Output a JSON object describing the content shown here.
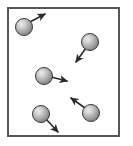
{
  "figure": {
    "title": "Gas particles in a container with velocity vectors",
    "canvas": {
      "width": 133,
      "height": 146
    },
    "background_color": "#ffffff"
  },
  "container_box": {
    "name": "container-box",
    "description": "Rectangular container enclosing the particles",
    "x": 8,
    "y": 8,
    "width": 111,
    "height": 128,
    "fill_color": "#ffffff",
    "stroke_color": "#575757",
    "stroke_width": 2
  },
  "sphere_style": {
    "radius": 8.5,
    "outline_color": "#3a3a3a",
    "outline_width": 1,
    "highlight_color": "#e8e8e8",
    "mid_color": "#a9a9a9",
    "edge_color": "#6e6e6e",
    "highlight_offset_x": "35%",
    "highlight_offset_y": "33%"
  },
  "arrow_style": {
    "stroke_color": "#2b2b2b",
    "stroke_width": 1.6,
    "head_length": 5.5,
    "head_width": 4.6
  },
  "particles": [
    {
      "id": "particle-1",
      "label": "top-left particle",
      "cx": 24,
      "cy": 27,
      "r": 8.5,
      "arrow": {
        "label": "velocity vector up-right",
        "direction": "up-right",
        "x1": 28,
        "y1": 23,
        "x2": 45,
        "y2": 14
      }
    },
    {
      "id": "particle-2",
      "label": "top-right particle",
      "cx": 90,
      "cy": 42,
      "r": 8.5,
      "arrow": {
        "label": "velocity vector down-left",
        "direction": "down-left",
        "x1": 86,
        "y1": 48,
        "x2": 76,
        "y2": 62
      }
    },
    {
      "id": "particle-3",
      "label": "center particle",
      "cx": 44,
      "cy": 76,
      "r": 8.5,
      "arrow": {
        "label": "velocity vector right",
        "direction": "right",
        "x1": 51,
        "y1": 77,
        "x2": 67,
        "y2": 81
      }
    },
    {
      "id": "particle-4",
      "label": "bottom-left particle",
      "cx": 41,
      "cy": 114,
      "r": 8.5,
      "arrow": {
        "label": "velocity vector down-right",
        "direction": "down-right",
        "x1": 46,
        "y1": 119,
        "x2": 58,
        "y2": 132
      }
    },
    {
      "id": "particle-5",
      "label": "bottom-right particle",
      "cx": 91,
      "cy": 113,
      "r": 8.5,
      "arrow": {
        "label": "velocity vector up-left",
        "direction": "up-left",
        "x1": 85,
        "y1": 108,
        "x2": 71,
        "y2": 98
      }
    }
  ]
}
